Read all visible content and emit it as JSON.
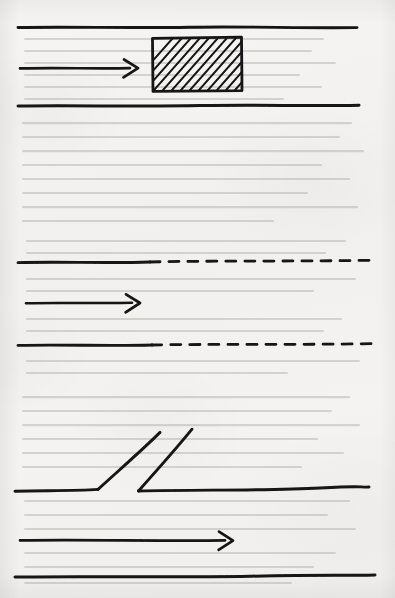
{
  "document": {
    "kind": "hand-drawn-diagram",
    "medium": "ink on paper",
    "sheet": {
      "width": 395,
      "height": 598
    },
    "paper_color": "#f3f2f0",
    "ink_color": "#141414",
    "visible_text": [],
    "note": "No legible printed or handwritten labels appear in the image; only faint illegible show-through text from the reverse side of the sheet."
  },
  "figure": {
    "title": "",
    "panel_count": 3,
    "panels": [
      {
        "id": "panel-top",
        "name": "duct-with-solid-blockage",
        "description": "Horizontal duct formed by two solid walls with a hatched solid rectangular block spanning the upper portion of the channel; a flow arrow points toward the block from the left.",
        "walls": [
          {
            "name": "upper-wall",
            "style": "solid",
            "x1": 18,
            "y1": 27,
            "x2": 357,
            "y2": 28
          },
          {
            "name": "lower-wall",
            "style": "solid",
            "x1": 18,
            "y1": 106,
            "x2": 359,
            "y2": 105
          }
        ],
        "arrows": [
          {
            "name": "flow-arrow",
            "x1": 20,
            "y1": 68,
            "x2": 138,
            "y2": 68,
            "direction": "right"
          }
        ],
        "blocks": [
          {
            "name": "hatched-block",
            "shape": "rectangle",
            "fill": "diagonal-hatch",
            "hatch_direction": "lower-left-to-upper-right",
            "hatch_spacing_px": 6,
            "x": 152,
            "y": 37,
            "width": 90,
            "height": 54
          }
        ]
      },
      {
        "id": "panel-middle",
        "name": "duct-with-porous-walls",
        "description": "Horizontal duct whose upper and lower walls begin as solid lines on the left and continue as dashed lines toward the right; a flow arrow points to the right along the centreline.",
        "walls": [
          {
            "name": "upper-wall-solid",
            "style": "solid",
            "x1": 18,
            "y1": 262,
            "x2": 150,
            "y2": 262
          },
          {
            "name": "upper-wall-dashed",
            "style": "dashed",
            "x1": 150,
            "y1": 262,
            "x2": 375,
            "y2": 260,
            "dash_px": 10,
            "gap_px": 9
          },
          {
            "name": "lower-wall-solid",
            "style": "solid",
            "x1": 18,
            "y1": 345,
            "x2": 152,
            "y2": 345
          },
          {
            "name": "lower-wall-dashed",
            "style": "dashed",
            "x1": 152,
            "y1": 345,
            "x2": 372,
            "y2": 344,
            "dash_px": 10,
            "gap_px": 9
          }
        ],
        "arrows": [
          {
            "name": "flow-arrow",
            "x1": 26,
            "y1": 303,
            "x2": 140,
            "y2": 303,
            "direction": "right"
          }
        ],
        "blocks": []
      },
      {
        "id": "panel-bottom",
        "name": "duct-with-angled-slot",
        "description": "Horizontal duct whose upper wall is interrupted by a slanted open slot: the wall bends upward to the right and a second parallel slanted line rises from a point further right, leaving an inclined gap; a longer flow arrow points to the right along the centreline.",
        "walls": [
          {
            "name": "upper-wall-left",
            "style": "solid",
            "x1": 15,
            "y1": 491,
            "x2": 98,
            "y2": 489
          },
          {
            "name": "slot-flange-left",
            "style": "solid",
            "x1": 98,
            "y1": 489,
            "x2": 160,
            "y2": 432
          },
          {
            "name": "slot-flange-right",
            "style": "solid",
            "x1": 138,
            "y1": 491,
            "x2": 192,
            "y2": 429
          },
          {
            "name": "upper-wall-right",
            "style": "solid",
            "x1": 138,
            "y1": 491,
            "x2": 369,
            "y2": 487
          },
          {
            "name": "lower-wall",
            "style": "solid",
            "x1": 15,
            "y1": 577,
            "x2": 375,
            "y2": 575
          }
        ],
        "arrows": [
          {
            "name": "flow-arrow",
            "x1": 20,
            "y1": 540,
            "x2": 233,
            "y2": 541,
            "direction": "right"
          }
        ],
        "blocks": []
      }
    ]
  }
}
